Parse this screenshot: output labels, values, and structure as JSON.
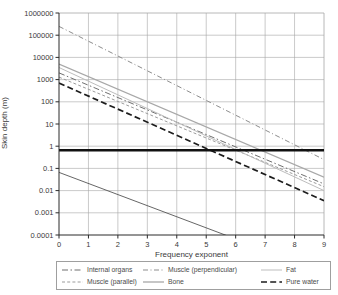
{
  "figure": {
    "background": "#ffffff",
    "axis_color": "#2b2b2b",
    "grid_color": "#a6a6a6",
    "tick_label_color": "#3a3a3a"
  },
  "chart_data": {
    "type": "line",
    "title": "",
    "xlabel": "Frequency exponent",
    "ylabel": "Skin depth (m)",
    "x_axis": {
      "min": 0,
      "max": 9,
      "ticks": [
        "0",
        "1",
        "2",
        "3",
        "4",
        "5",
        "6",
        "7",
        "8",
        "9"
      ]
    },
    "y_axis": {
      "scale": "log",
      "min": 0.0001,
      "max": 1000000,
      "ticks": [
        "1000000",
        "100000",
        "10000",
        "1000",
        "100",
        "10",
        "1",
        "0.1",
        "0.01",
        "0.001",
        "0.0001"
      ]
    },
    "grid": true,
    "legend_position": "bottom",
    "series": [
      {
        "key": "internal-organs",
        "name": "Internal organs",
        "color": "#6f6f6f",
        "width": 1,
        "dash": "6,2.5,1.5,2.5",
        "points": [
          [
            0,
            2000
          ],
          [
            9,
            0.02
          ]
        ]
      },
      {
        "key": "muscle-parallel",
        "name": "Muscle (parallel)",
        "color": "#9b9b9b",
        "width": 1,
        "dash": "3,2.2",
        "points": [
          [
            0,
            1300
          ],
          [
            9,
            0.015
          ]
        ]
      },
      {
        "key": "muscle-perpendicular",
        "name": "Muscle (perpendicular)",
        "color": "#8d8d8d",
        "width": 1,
        "dash": "5,2.5,1,2.5",
        "points": [
          [
            0,
            250000
          ],
          [
            9,
            0.25
          ]
        ]
      },
      {
        "key": "bone",
        "name": "Bone",
        "color": "#a8a8a8",
        "width": 1.3,
        "dash": null,
        "points": [
          [
            0,
            5000
          ],
          [
            9,
            0.04
          ]
        ]
      },
      {
        "key": "fat",
        "name": "Fat",
        "color": "#bdbdbd",
        "width": 1,
        "dash": null,
        "points": [
          [
            0,
            3500
          ],
          [
            9,
            0.01
          ]
        ]
      },
      {
        "key": "pure-water",
        "name": "Pure water",
        "color": "#1c1c1c",
        "width": 1.7,
        "dash": "6,3.2",
        "points": [
          [
            0,
            700
          ],
          [
            9,
            0.0035
          ]
        ]
      }
    ],
    "reference_lines": [
      {
        "key": "horizontal-threshold",
        "color": "#111111",
        "width": 2.6,
        "dash": null,
        "points": [
          [
            0,
            0.66
          ],
          [
            9,
            0.66
          ]
        ]
      },
      {
        "key": "unlabeled-steep-line",
        "color": "#555555",
        "width": 0.9,
        "dash": null,
        "points": [
          [
            0,
            0.066
          ],
          [
            9,
            2.1e-06
          ]
        ]
      }
    ]
  },
  "legend": {
    "columns": [
      [
        "internal-organs",
        "muscle-parallel"
      ],
      [
        "muscle-perpendicular",
        "bone"
      ],
      [
        "fat",
        "pure-water"
      ]
    ]
  }
}
